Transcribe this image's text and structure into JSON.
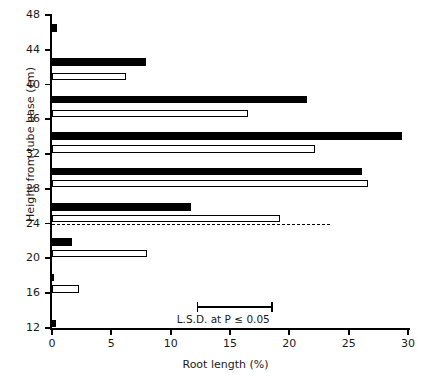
{
  "chart_data": {
    "type": "bar",
    "orientation": "horizontal",
    "title": "",
    "xlabel": "Root length (%)",
    "ylabel": "Height from tube base (cm)",
    "xlim": [
      0,
      30
    ],
    "ylim": [
      12,
      48
    ],
    "xticks": [
      0,
      5,
      10,
      15,
      20,
      25,
      30
    ],
    "yticks": [
      12,
      16,
      20,
      24,
      28,
      32,
      36,
      40,
      44,
      48
    ],
    "grid": false,
    "legend": null,
    "legend_position": "none",
    "series": [
      {
        "name": "filled",
        "style": "black-filled",
        "points": [
          {
            "y": 46.5,
            "value": 0.4
          },
          {
            "y": 42.6,
            "value": 7.9
          },
          {
            "y": 38.3,
            "value": 21.5
          },
          {
            "y": 34.1,
            "value": 29.5
          },
          {
            "y": 30.0,
            "value": 26.1
          },
          {
            "y": 25.9,
            "value": 11.7
          },
          {
            "y": 21.9,
            "value": 1.7
          },
          {
            "y": 17.8,
            "value": 0.2
          },
          {
            "y": 12.5,
            "value": 0.3
          }
        ]
      },
      {
        "name": "open",
        "style": "white-open",
        "points": [
          {
            "y": 40.9,
            "value": 6.2
          },
          {
            "y": 36.7,
            "value": 16.5
          },
          {
            "y": 32.6,
            "value": 22.2
          },
          {
            "y": 28.6,
            "value": 26.6
          },
          {
            "y": 24.6,
            "value": 19.2
          },
          {
            "y": 20.6,
            "value": 8.0
          },
          {
            "y": 16.5,
            "value": 2.3
          }
        ]
      }
    ],
    "annotations": [
      {
        "kind": "dashed-horizontal-line",
        "y": 24.0,
        "x_end": 23.4
      },
      {
        "kind": "error-bar",
        "label": "L.S.D. at P ≤ 0.05",
        "x_start": 12.2,
        "x_end": 18.6,
        "y": 14.5
      }
    ]
  },
  "axes": {
    "y_label": "Height from tube base (cm)",
    "x_label": "Root length (%)",
    "y_tick_labels": [
      "48",
      "44",
      "40",
      "36",
      "32",
      "28",
      "24",
      "20",
      "16",
      "12"
    ],
    "x_tick_labels": [
      "0",
      "5",
      "10",
      "15",
      "20",
      "25",
      "30"
    ]
  },
  "annotation": {
    "lsd_text": "L.S.D. at P ≤ 0.05"
  },
  "colors": {
    "filled_bar": "#000000",
    "open_bar": "#ffffff",
    "axis": "#000000",
    "text": "#1a1a1a"
  }
}
